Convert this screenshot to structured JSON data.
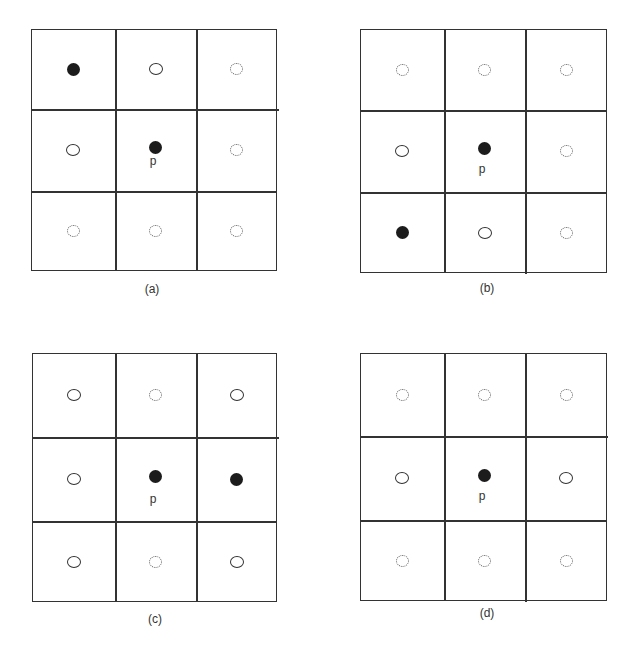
{
  "figure": {
    "center_label": "p",
    "legend": {
      "filled": "filled-circle",
      "open": "open-circle",
      "dotted": "dotted-circle"
    },
    "panels": [
      {
        "caption": "(a)",
        "cells": [
          [
            "filled",
            "open",
            "dotted"
          ],
          [
            "open",
            "filled",
            "dotted"
          ],
          [
            "dotted",
            "dotted",
            "dotted"
          ]
        ]
      },
      {
        "caption": "(b)",
        "cells": [
          [
            "dotted",
            "dotted",
            "dotted"
          ],
          [
            "open",
            "filled",
            "dotted"
          ],
          [
            "filled",
            "open",
            "dotted"
          ]
        ]
      },
      {
        "caption": "(c)",
        "cells": [
          [
            "open",
            "dotted",
            "open"
          ],
          [
            "open",
            "filled",
            "filled"
          ],
          [
            "open",
            "dotted",
            "open"
          ]
        ]
      },
      {
        "caption": "(d)",
        "cells": [
          [
            "dotted",
            "dotted",
            "dotted"
          ],
          [
            "open",
            "filled",
            "open"
          ],
          [
            "dotted",
            "dotted",
            "dotted"
          ]
        ]
      }
    ]
  }
}
